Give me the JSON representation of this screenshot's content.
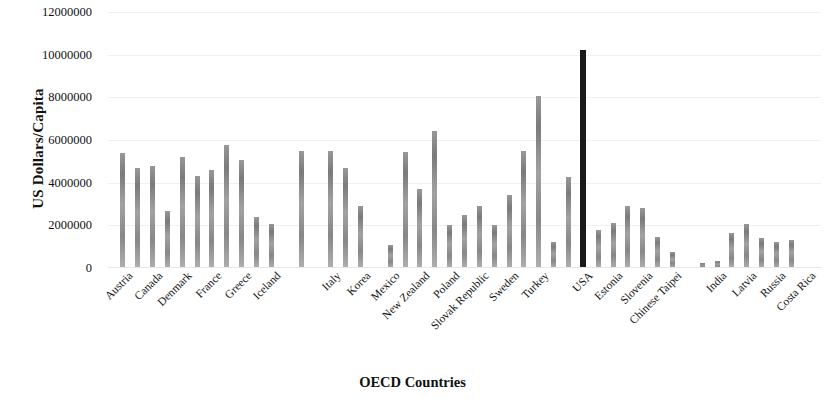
{
  "chart_data": {
    "type": "bar",
    "title": "",
    "xlabel": "OECD Countries",
    "ylabel": "US Dollars/Capita",
    "ylim": [
      0,
      12000000
    ],
    "ytick_labels": [
      "12000000",
      "10000000",
      "8000000",
      "6000000",
      "4000000",
      "2000000",
      "0"
    ],
    "ytick_values": [
      12000000,
      10000000,
      8000000,
      6000000,
      4000000,
      2000000,
      0
    ],
    "grid": true,
    "legend": "none",
    "categories": [
      "Austria",
      "Canada",
      "Denmark",
      "France",
      "Greece",
      "Iceland",
      "Italy",
      "Korea",
      "Mexico",
      "New Zealand",
      "Poland",
      "Slovak Republic",
      "Sweden",
      "Turkey",
      "USA",
      "Estonia",
      "Slovenia",
      "Chinese Taipei",
      "India",
      "Latvia",
      "Russia",
      "Costa Rica"
    ],
    "bars": [
      {
        "label": "Austria",
        "x": 1,
        "value": 5400000,
        "highlight": false
      },
      {
        "label": "",
        "x": 2,
        "value": 4700000,
        "highlight": false
      },
      {
        "label": "Canada",
        "x": 3,
        "value": 4800000,
        "highlight": false
      },
      {
        "label": "",
        "x": 4,
        "value": 2650000,
        "highlight": false
      },
      {
        "label": "Denmark",
        "x": 5,
        "value": 5200000,
        "highlight": false
      },
      {
        "label": "",
        "x": 6,
        "value": 4300000,
        "highlight": false
      },
      {
        "label": "France",
        "x": 7,
        "value": 4600000,
        "highlight": false
      },
      {
        "label": "",
        "x": 8,
        "value": 5750000,
        "highlight": false
      },
      {
        "label": "Greece",
        "x": 9,
        "value": 5050000,
        "highlight": false
      },
      {
        "label": "",
        "x": 10,
        "value": 2400000,
        "highlight": false
      },
      {
        "label": "Iceland",
        "x": 11,
        "value": 2050000,
        "highlight": false
      },
      {
        "label": "",
        "x": 13,
        "value": 5500000,
        "highlight": false
      },
      {
        "label": "Italy",
        "x": 15,
        "value": 5500000,
        "highlight": false
      },
      {
        "label": "",
        "x": 16,
        "value": 4700000,
        "highlight": false
      },
      {
        "label": "Korea",
        "x": 17,
        "value": 2900000,
        "highlight": false
      },
      {
        "label": "Mexico",
        "x": 19,
        "value": 1100000,
        "highlight": false
      },
      {
        "label": "",
        "x": 20,
        "value": 5450000,
        "highlight": false
      },
      {
        "label": "New Zealand",
        "x": 21,
        "value": 3700000,
        "highlight": false
      },
      {
        "label": "",
        "x": 22,
        "value": 6400000,
        "highlight": false
      },
      {
        "label": "Poland",
        "x": 23,
        "value": 2000000,
        "highlight": false
      },
      {
        "label": "",
        "x": 24,
        "value": 2500000,
        "highlight": false
      },
      {
        "label": "Slovak Republic",
        "x": 25,
        "value": 2900000,
        "highlight": false
      },
      {
        "label": "",
        "x": 26,
        "value": 2000000,
        "highlight": false
      },
      {
        "label": "Sweden",
        "x": 27,
        "value": 3400000,
        "highlight": false
      },
      {
        "label": "",
        "x": 28,
        "value": 5500000,
        "highlight": false
      },
      {
        "label": "Turkey",
        "x": 29,
        "value": 8050000,
        "highlight": false
      },
      {
        "label": "",
        "x": 30,
        "value": 1200000,
        "highlight": false
      },
      {
        "label": "USA",
        "x": 31,
        "value": 4250000,
        "highlight": false
      },
      {
        "label": "",
        "x": 32,
        "value": 10200000,
        "highlight": true
      },
      {
        "label": "Estonia",
        "x": 33,
        "value": 1800000,
        "highlight": false
      },
      {
        "label": "",
        "x": 34,
        "value": 2100000,
        "highlight": false
      },
      {
        "label": "Slovenia",
        "x": 35,
        "value": 2900000,
        "highlight": false
      },
      {
        "label": "",
        "x": 36,
        "value": 2800000,
        "highlight": false
      },
      {
        "label": "Chinese Taipei",
        "x": 37,
        "value": 1450000,
        "highlight": false
      },
      {
        "label": "",
        "x": 38,
        "value": 750000,
        "highlight": false
      },
      {
        "label": "India",
        "x": 40,
        "value": 220000,
        "highlight": false
      },
      {
        "label": "",
        "x": 41,
        "value": 330000,
        "highlight": false
      },
      {
        "label": "Latvia",
        "x": 42,
        "value": 1650000,
        "highlight": false
      },
      {
        "label": "",
        "x": 43,
        "value": 2050000,
        "highlight": false
      },
      {
        "label": "Russia",
        "x": 44,
        "value": 1400000,
        "highlight": false
      },
      {
        "label": "",
        "x": 45,
        "value": 1200000,
        "highlight": false
      },
      {
        "label": "Costa Rica",
        "x": 46,
        "value": 1300000,
        "highlight": false
      }
    ],
    "category_slots": [
      {
        "label": "Austria",
        "slot": 1
      },
      {
        "label": "Canada",
        "slot": 3
      },
      {
        "label": "Denmark",
        "slot": 5
      },
      {
        "label": "France",
        "slot": 7
      },
      {
        "label": "Greece",
        "slot": 9
      },
      {
        "label": "Iceland",
        "slot": 11
      },
      {
        "label": "Italy",
        "slot": 15
      },
      {
        "label": "Korea",
        "slot": 17
      },
      {
        "label": "Mexico",
        "slot": 19
      },
      {
        "label": "New Zealand",
        "slot": 21
      },
      {
        "label": "Poland",
        "slot": 23
      },
      {
        "label": "Slovak Republic",
        "slot": 25
      },
      {
        "label": "Sweden",
        "slot": 27
      },
      {
        "label": "Turkey",
        "slot": 29
      },
      {
        "label": "USA",
        "slot": 32
      },
      {
        "label": "Estonia",
        "slot": 34
      },
      {
        "label": "Slovenia",
        "slot": 36
      },
      {
        "label": "Chinese Taipei",
        "slot": 38
      },
      {
        "label": "India",
        "slot": 41
      },
      {
        "label": "Latvia",
        "slot": 43
      },
      {
        "label": "Russia",
        "slot": 45
      },
      {
        "label": "Costa Rica",
        "slot": 47
      }
    ],
    "slot_count": 48,
    "colors": {
      "bar": "#8a8a8a",
      "highlight_bar": "#1a1a1a",
      "grid": "#f0f0f0",
      "text": "#111111"
    }
  }
}
